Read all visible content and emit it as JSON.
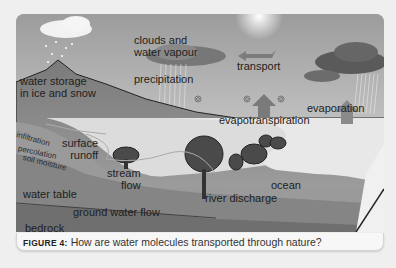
{
  "diagram": {
    "labels": {
      "clouds": [
        "clouds and",
        "water vapour"
      ],
      "transport": "transport",
      "precipitation": "precipitation",
      "water_storage": [
        "water storage",
        "in ice and snow"
      ],
      "evaporation": "evaporation",
      "evapotranspiration": "evapotranspiration",
      "infiltration": "infiltration",
      "percolation": "percolation",
      "soil_moisture": "soil moisture",
      "surface_runoff": [
        "surface",
        "runoff"
      ],
      "stream_flow": [
        "stream",
        "flow"
      ],
      "water_table": "water table",
      "ocean": "ocean",
      "river_discharge": "river discharge",
      "ground_water_flow": "ground water flow",
      "bedrock": "bedrock"
    },
    "icons": [
      "sun-icon",
      "cloud-icon",
      "rain-icon",
      "snow-icon",
      "tree-icon",
      "arrow-up-icon",
      "arrow-left-icon",
      "swirl-icon"
    ]
  },
  "caption": {
    "figure_number": "FIGURE 4:",
    "text": " How are water molecules transported through nature?"
  }
}
